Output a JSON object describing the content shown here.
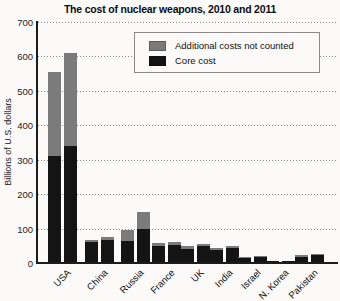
{
  "chart_data": {
    "type": "bar",
    "subtype": "grouped-stacked",
    "title": "The cost of nuclear weapons, 2010 and 2011",
    "xlabel": "",
    "ylabel": "Billions of U.S. dollars",
    "ylim": [
      0,
      700
    ],
    "yticks": [
      0,
      100,
      200,
      300,
      400,
      500,
      600,
      700
    ],
    "grid": "dotted horizontal gridlines at every 100",
    "legend_position": "top-center inside plot, boxed",
    "legend": [
      {
        "label": "Additional costs not counted",
        "color": "#7b7b7b",
        "key": "additional"
      },
      {
        "label": "Core cost",
        "color": "#141414",
        "key": "core"
      }
    ],
    "categories": [
      "USA",
      "China",
      "Russia",
      "France",
      "UK",
      "India",
      "Israel",
      "N. Korea",
      "Pakistan"
    ],
    "years_per_category": [
      2010,
      2011
    ],
    "countries": [
      {
        "name": "USA",
        "y2010": {
          "core": 310,
          "additional": 245
        },
        "y2011": {
          "core": 340,
          "additional": 270
        }
      },
      {
        "name": "China",
        "y2010": {
          "core": 60,
          "additional": 8
        },
        "y2011": {
          "core": 68,
          "additional": 8
        }
      },
      {
        "name": "Russia",
        "y2010": {
          "core": 65,
          "additional": 32
        },
        "y2011": {
          "core": 100,
          "additional": 48
        }
      },
      {
        "name": "France",
        "y2010": {
          "core": 48,
          "additional": 10
        },
        "y2011": {
          "core": 52,
          "additional": 8
        }
      },
      {
        "name": "UK",
        "y2010": {
          "core": 42,
          "additional": 6
        },
        "y2011": {
          "core": 48,
          "additional": 8
        }
      },
      {
        "name": "India",
        "y2010": {
          "core": 38,
          "additional": 5
        },
        "y2011": {
          "core": 44,
          "additional": 5
        }
      },
      {
        "name": "Israel",
        "y2010": {
          "core": 16,
          "additional": 2
        },
        "y2011": {
          "core": 18,
          "additional": 2
        }
      },
      {
        "name": "N. Korea",
        "y2010": {
          "core": 5,
          "additional": 1
        },
        "y2011": {
          "core": 6,
          "additional": 1
        }
      },
      {
        "name": "Pakistan",
        "y2010": {
          "core": 18,
          "additional": 6
        },
        "y2011": {
          "core": 24,
          "additional": 3
        }
      }
    ],
    "colors": {
      "core": "#141414",
      "additional": "#7b7b7b",
      "axis": "#1c1c1c",
      "background": "#fbfaf8"
    }
  }
}
